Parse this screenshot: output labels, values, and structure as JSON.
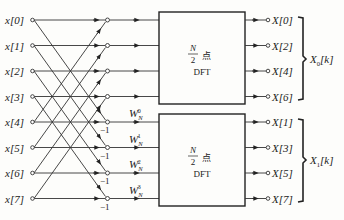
{
  "diagram": {
    "type": "signal-flow",
    "title": "",
    "inputs": [
      "x[0]",
      "x[1]",
      "x[2]",
      "x[3]",
      "x[4]",
      "x[5]",
      "x[6]",
      "x[7]"
    ],
    "twiddles": [
      {
        "base": "W",
        "sub": "N",
        "sup": "0"
      },
      {
        "base": "W",
        "sub": "N",
        "sup": "1"
      },
      {
        "base": "W",
        "sub": "N",
        "sup": "2"
      },
      {
        "base": "W",
        "sub": "N",
        "sup": "3"
      }
    ],
    "minus_one": "−1",
    "blocks": [
      {
        "num": "N",
        "den": "2",
        "unit": "点",
        "name": "DFT"
      },
      {
        "num": "N",
        "den": "2",
        "unit": "点",
        "name": "DFT"
      }
    ],
    "outputs_top": [
      "X[0]",
      "X[2]",
      "X[4]",
      "X[6]"
    ],
    "outputs_bottom": [
      "X[1]",
      "X[3]",
      "X[5]",
      "X[7]"
    ],
    "group_labels": [
      {
        "base": "X",
        "sub": "0",
        "arg": "[k]"
      },
      {
        "base": "X",
        "sub": "1",
        "arg": "[k]"
      }
    ]
  }
}
